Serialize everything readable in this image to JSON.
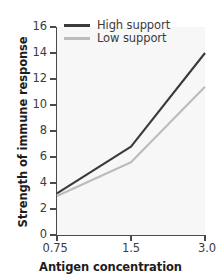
{
  "chart_data": {
    "type": "line",
    "title": "",
    "xlabel": "Antigen concentration",
    "ylabel": "Strength of immune response",
    "categories": [
      "0.75",
      "1.5",
      "3.0"
    ],
    "x_tick_labels": [
      "0.75",
      "1.5",
      "3.0"
    ],
    "y_tick_labels": [
      "0",
      "2",
      "4",
      "6",
      "8",
      "10",
      "12",
      "14",
      "16"
    ],
    "y_ticks": [
      0,
      2,
      4,
      6,
      8,
      10,
      12,
      14,
      16
    ],
    "ylim": [
      0,
      16
    ],
    "grid": false,
    "legend_position": "top-left",
    "series": [
      {
        "name": "High support",
        "color": "#3a3a3a",
        "values": [
          3.2,
          6.8,
          14.0
        ]
      },
      {
        "name": "Low support",
        "color": "#bcbcbc",
        "values": [
          3.0,
          5.6,
          11.4
        ]
      }
    ]
  },
  "legend": {
    "items": [
      {
        "label": "High support"
      },
      {
        "label": "Low support"
      }
    ]
  },
  "axes": {
    "x_title": "Antigen concentration",
    "y_title": "Strength of immune response"
  },
  "colors": {
    "high_support": "#3a3a3a",
    "low_support": "#bcbcbc",
    "axis": "#4a4a4a",
    "plot_background": "#f7f7f7",
    "figure_background": "#ffffff",
    "tick_text": "#3c3c3c",
    "title_text": "#1d1d1d"
  }
}
